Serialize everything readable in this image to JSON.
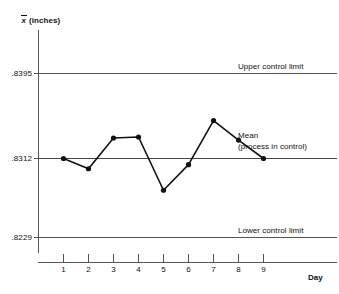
{
  "chart_data": {
    "type": "line",
    "title": "",
    "subtitle": "",
    "xlabel": "Day",
    "ylabel": "x̄ (inches)",
    "ylabel_symbol": "x",
    "ylabel_units": "(inches)",
    "x": [
      1,
      2,
      3,
      4,
      5,
      6,
      7,
      8,
      9
    ],
    "categories": [
      "1",
      "2",
      "3",
      "4",
      "5",
      "6",
      "7",
      "8",
      "9"
    ],
    "series": [
      {
        "name": "Sample mean",
        "values": [
          0.8312,
          0.8302,
          0.8332,
          0.8333,
          0.8281,
          0.8306,
          0.8349,
          0.833,
          0.8312
        ]
      }
    ],
    "ylim": [
      0.8229,
      0.8395
    ],
    "xlim": [
      0,
      10
    ],
    "yticks": [
      0.8229,
      0.8312,
      0.8395
    ],
    "ytick_labels": [
      ".8229",
      ".8312",
      ".8395"
    ],
    "xtick_labels": [
      "1",
      "2",
      "3",
      "4",
      "5",
      "6",
      "7",
      "8",
      "9"
    ],
    "grid": false,
    "legend": "none",
    "reference_lines": [
      {
        "id": "ucl",
        "value": 0.8395,
        "tick_label": ".8395",
        "annotation": "Upper control limit"
      },
      {
        "id": "mean",
        "value": 0.8312,
        "tick_label": ".8312",
        "annotation_line1": "Mean",
        "annotation_line2": "(process in control)"
      },
      {
        "id": "lcl",
        "value": 0.8229,
        "tick_label": ".8229",
        "annotation": "Lower control limit"
      }
    ],
    "colors": {
      "line": "#111111",
      "marker": "#111111",
      "reference_line": "#555555",
      "axis": "#555555",
      "background": "#ffffff",
      "text": "#111111"
    }
  },
  "annotations": {
    "upper_control_limit": "Upper control limit",
    "mean_line1": "Mean",
    "mean_line2": "(process in control)",
    "lower_control_limit": "Lower control limit"
  },
  "axes": {
    "y_title_symbol": "x",
    "y_title_units": "(inches)",
    "x_title": "Day"
  },
  "ytick_labels": {
    "upper": ".8395",
    "middle": ".8312",
    "lower": ".8229"
  },
  "xtick_labels": {
    "d1": "1",
    "d2": "2",
    "d3": "3",
    "d4": "4",
    "d5": "5",
    "d6": "6",
    "d7": "7",
    "d8": "8",
    "d9": "9"
  }
}
